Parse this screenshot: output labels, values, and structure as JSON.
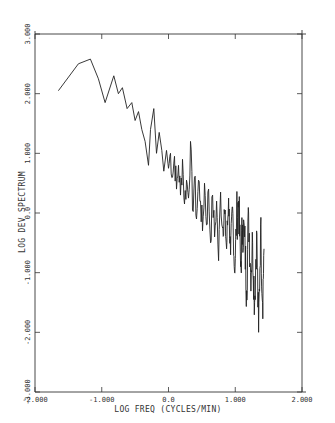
{
  "chart_data": {
    "type": "line",
    "title": "",
    "xlabel": "LOG FREQ (CYCLES/MIN)",
    "ylabel": "LOG DEV SPECTRUM",
    "xlim": [
      -2.0,
      2.0
    ],
    "ylim": [
      -3.0,
      3.0
    ],
    "x_ticks": [
      -2.0,
      -1.0,
      0.0,
      1.0,
      2.0
    ],
    "x_tick_labels": [
      "-2.000",
      "-1.000",
      "0.0",
      "1.000",
      "2.000"
    ],
    "y_ticks": [
      -3.0,
      -2.0,
      -1.0,
      0.0,
      1.0,
      2.0,
      3.0
    ],
    "y_tick_labels": [
      "-3.000",
      "-2.000",
      "-1.000",
      "0.0",
      "1.000",
      "2.000",
      "3.000"
    ],
    "grid": false,
    "legend": null,
    "series": [
      {
        "name": "spectrum",
        "color": "#222222",
        "x": [
          -1.65,
          -1.35,
          -1.17,
          -1.05,
          -0.95,
          -0.82,
          -0.75,
          -0.69,
          -0.62,
          -0.55,
          -0.5,
          -0.45,
          -0.4,
          -0.35,
          -0.3,
          -0.27,
          -0.22,
          -0.18,
          -0.14,
          -0.1,
          -0.07,
          -0.03,
          0.0,
          0.03,
          0.06,
          0.09,
          0.12,
          0.15,
          0.18,
          0.21,
          0.24,
          0.27,
          0.3,
          0.33,
          0.36,
          0.39,
          0.42,
          0.45,
          0.48,
          0.51,
          0.54,
          0.57,
          0.6,
          0.63,
          0.66,
          0.69,
          0.72,
          0.75,
          0.78,
          0.81,
          0.84,
          0.87,
          0.9,
          0.93,
          0.96,
          0.99,
          1.02,
          1.05,
          1.08,
          1.11,
          1.14,
          1.17,
          1.2,
          1.23,
          1.26,
          1.29,
          1.32,
          1.35,
          1.38,
          1.41,
          1.43
        ],
        "y": [
          2.05,
          2.5,
          2.58,
          2.25,
          1.85,
          2.3,
          2.0,
          2.1,
          1.75,
          1.85,
          1.55,
          1.7,
          1.4,
          1.2,
          0.8,
          1.4,
          1.75,
          1.0,
          1.35,
          1.05,
          0.7,
          1.05,
          0.75,
          1.0,
          0.6,
          0.95,
          0.4,
          0.8,
          0.3,
          0.9,
          0.15,
          0.55,
          0.25,
          1.2,
          0.05,
          0.6,
          -0.1,
          0.55,
          0.2,
          -0.3,
          0.5,
          -0.2,
          0.4,
          -0.5,
          0.3,
          -0.4,
          0.2,
          -0.8,
          0.35,
          -0.25,
          0.0,
          -0.6,
          0.25,
          -0.7,
          0.1,
          -1.0,
          -0.1,
          0.2,
          -0.9,
          -0.2,
          -0.4,
          -1.3,
          0.0,
          -1.0,
          -0.5,
          -1.5,
          -0.3,
          -2.0,
          -0.2,
          -1.5,
          -0.6
        ]
      }
    ]
  }
}
